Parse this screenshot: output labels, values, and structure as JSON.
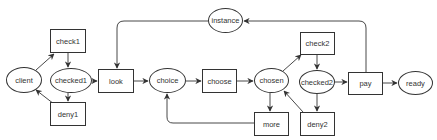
{
  "diagram": {
    "type": "petri-net-flow",
    "colors": {
      "stroke": "#333333",
      "fill": "#ffffff",
      "text": "#333333"
    },
    "nodes": [
      {
        "id": "client",
        "label": "client",
        "shape": "ellipse",
        "x": 6,
        "y": 67,
        "w": 36,
        "h": 26
      },
      {
        "id": "check1",
        "label": "check1",
        "shape": "rectangle",
        "x": 50,
        "y": 29,
        "w": 36,
        "h": 24
      },
      {
        "id": "checked1",
        "label": "checked1",
        "shape": "ellipse",
        "x": 50,
        "y": 68,
        "w": 42,
        "h": 25
      },
      {
        "id": "deny1",
        "label": "deny1",
        "shape": "rectangle",
        "x": 50,
        "y": 102,
        "w": 36,
        "h": 24
      },
      {
        "id": "look",
        "label": "look",
        "shape": "rectangle",
        "x": 98,
        "y": 69,
        "w": 36,
        "h": 24
      },
      {
        "id": "choice",
        "label": "choice",
        "shape": "ellipse",
        "x": 149,
        "y": 68,
        "w": 37,
        "h": 25
      },
      {
        "id": "instance",
        "label": "instance",
        "shape": "ellipse",
        "x": 208,
        "y": 8,
        "w": 35,
        "h": 25
      },
      {
        "id": "choose",
        "label": "choose",
        "shape": "rectangle",
        "x": 202,
        "y": 69,
        "w": 35,
        "h": 24
      },
      {
        "id": "chosen",
        "label": "chosen",
        "shape": "ellipse",
        "x": 254,
        "y": 68,
        "w": 35,
        "h": 25
      },
      {
        "id": "more",
        "label": "more",
        "shape": "rectangle",
        "x": 254,
        "y": 112,
        "w": 35,
        "h": 24
      },
      {
        "id": "check2",
        "label": "check2",
        "shape": "rectangle",
        "x": 300,
        "y": 32,
        "w": 35,
        "h": 23
      },
      {
        "id": "checked2",
        "label": "checked2",
        "shape": "ellipse",
        "x": 299,
        "y": 70,
        "w": 36,
        "h": 24
      },
      {
        "id": "deny2",
        "label": "deny2",
        "shape": "rectangle",
        "x": 300,
        "y": 112,
        "w": 35,
        "h": 24
      },
      {
        "id": "pay",
        "label": "pay",
        "shape": "rectangle",
        "x": 348,
        "y": 72,
        "w": 35,
        "h": 23
      },
      {
        "id": "ready",
        "label": "ready",
        "shape": "ellipse",
        "x": 398,
        "y": 71,
        "w": 35,
        "h": 24
      }
    ],
    "edges": [
      {
        "from": "client",
        "to": "check1"
      },
      {
        "from": "check1",
        "to": "checked1"
      },
      {
        "from": "checked1",
        "to": "deny1"
      },
      {
        "from": "deny1",
        "to": "client"
      },
      {
        "from": "checked1",
        "to": "look"
      },
      {
        "from": "look",
        "to": "choice"
      },
      {
        "from": "choice",
        "to": "choose"
      },
      {
        "from": "choose",
        "to": "chosen"
      },
      {
        "from": "chosen",
        "to": "more"
      },
      {
        "from": "more",
        "to": "choice"
      },
      {
        "from": "chosen",
        "to": "check2"
      },
      {
        "from": "check2",
        "to": "checked2"
      },
      {
        "from": "checked2",
        "to": "deny2"
      },
      {
        "from": "deny2",
        "to": "chosen"
      },
      {
        "from": "checked2",
        "to": "pay"
      },
      {
        "from": "pay",
        "to": "ready"
      },
      {
        "from": "pay",
        "to": "instance"
      },
      {
        "from": "instance",
        "to": "look"
      }
    ]
  }
}
